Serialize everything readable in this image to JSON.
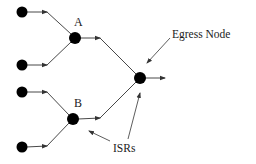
{
  "diagram": {
    "colors": {
      "node": "#000000",
      "line": "#333333",
      "text": "#1a1a1a",
      "background": "#ffffff"
    },
    "labels": {
      "node_a": "A",
      "node_b": "B",
      "egress": "Egress Node",
      "isrs": "ISRs"
    },
    "nodes": [
      {
        "id": "src1",
        "x": 22,
        "y": 12
      },
      {
        "id": "src2",
        "x": 22,
        "y": 65
      },
      {
        "id": "src3",
        "x": 22,
        "y": 92
      },
      {
        "id": "src4",
        "x": 22,
        "y": 147
      },
      {
        "id": "A",
        "x": 75,
        "y": 38
      },
      {
        "id": "B",
        "x": 73,
        "y": 119
      },
      {
        "id": "egress",
        "x": 140,
        "y": 78
      }
    ],
    "edges": [
      {
        "from": "src1",
        "to": "A"
      },
      {
        "from": "src2",
        "to": "A"
      },
      {
        "from": "src3",
        "to": "B"
      },
      {
        "from": "src4",
        "to": "B"
      },
      {
        "from": "A",
        "to": "egress"
      },
      {
        "from": "B",
        "to": "egress"
      },
      {
        "from": "egress",
        "to": "output"
      }
    ]
  }
}
